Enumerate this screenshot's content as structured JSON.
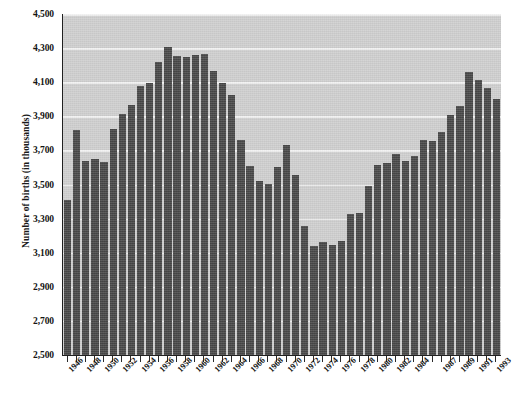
{
  "chart_data": {
    "type": "bar",
    "title": "",
    "xlabel": "",
    "ylabel": "Number of births (in thousands)",
    "ylim": [
      2500,
      4500
    ],
    "ytick_step": 200,
    "ytick_labels": [
      "4,500",
      "4,300",
      "4,100",
      "3,900",
      "3,700",
      "3,500",
      "3,300",
      "3,100",
      "2,900",
      "2,700",
      "2,500"
    ],
    "ytick_values": [
      4500,
      4300,
      4100,
      3900,
      3700,
      3500,
      3300,
      3100,
      2900,
      2700,
      2500
    ],
    "grid": true,
    "grid_color": "#f3f3f3",
    "legend": "none",
    "bar_color": "#4c4c4c",
    "plot_background": "#d2d2d2",
    "xtick_labels_shown": [
      "1946",
      "1948",
      "1950",
      "1952",
      "1954",
      "1956",
      "1958",
      "1960",
      "1962",
      "1964",
      "1966",
      "1968",
      "1970",
      "1972",
      "1974",
      "1976",
      "1978",
      "1980",
      "1982",
      "1984",
      "1987",
      "1989",
      "1991",
      "1993"
    ],
    "categories": [
      "1946",
      "1947",
      "1948",
      "1949",
      "1950",
      "1951",
      "1952",
      "1953",
      "1954",
      "1955",
      "1956",
      "1957",
      "1958",
      "1959",
      "1960",
      "1961",
      "1962",
      "1963",
      "1964",
      "1965",
      "1966",
      "1967",
      "1968",
      "1969",
      "1970",
      "1971",
      "1972",
      "1973",
      "1974",
      "1975",
      "1976",
      "1977",
      "1978",
      "1979",
      "1980",
      "1981",
      "1982",
      "1983",
      "1984",
      "1985",
      "1986",
      "1987",
      "1988",
      "1989",
      "1990",
      "1991",
      "1992",
      "1993"
    ],
    "values": [
      3411,
      3817,
      3637,
      3649,
      3632,
      3823,
      3913,
      3965,
      4078,
      4097,
      4218,
      4308,
      4255,
      4245,
      4258,
      4268,
      4167,
      4098,
      4027,
      3760,
      3606,
      3521,
      3502,
      3600,
      3731,
      3556,
      3258,
      3137,
      3160,
      3144,
      3168,
      3327,
      3333,
      3494,
      3612,
      3629,
      3681,
      3639,
      3669,
      3761,
      3757,
      3809,
      3910,
      3960,
      4158,
      4111,
      4065,
      4000
    ]
  }
}
